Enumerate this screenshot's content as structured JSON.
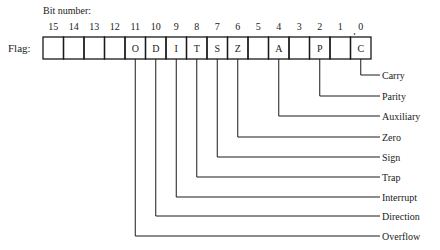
{
  "header": {
    "bit_number_label": "Bit number:"
  },
  "register": {
    "row_label": "Flag:",
    "bits": [
      {
        "bit": "15",
        "flag": ""
      },
      {
        "bit": "14",
        "flag": ""
      },
      {
        "bit": "13",
        "flag": ""
      },
      {
        "bit": "12",
        "flag": ""
      },
      {
        "bit": "11",
        "flag": "O"
      },
      {
        "bit": "10",
        "flag": "D"
      },
      {
        "bit": "9",
        "flag": "I"
      },
      {
        "bit": "8",
        "flag": "T"
      },
      {
        "bit": "7",
        "flag": "S"
      },
      {
        "bit": "6",
        "flag": "Z"
      },
      {
        "bit": "5",
        "flag": ""
      },
      {
        "bit": "4",
        "flag": "A"
      },
      {
        "bit": "3",
        "flag": ""
      },
      {
        "bit": "2",
        "flag": "P"
      },
      {
        "bit": "1",
        "flag": ""
      },
      {
        "bit": "0",
        "flag": "C"
      }
    ]
  },
  "legend": [
    {
      "bit": 0,
      "letter": "C",
      "name": "Carry"
    },
    {
      "bit": 2,
      "letter": "P",
      "name": "Parity"
    },
    {
      "bit": 4,
      "letter": "A",
      "name": "Auxiliary"
    },
    {
      "bit": 6,
      "letter": "Z",
      "name": "Zero"
    },
    {
      "bit": 7,
      "letter": "S",
      "name": "Sign"
    },
    {
      "bit": 8,
      "letter": "T",
      "name": "Trap"
    },
    {
      "bit": 9,
      "letter": "I",
      "name": "Interrupt"
    },
    {
      "bit": 10,
      "letter": "D",
      "name": "Direction"
    },
    {
      "bit": 11,
      "letter": "O",
      "name": "Overflow"
    }
  ],
  "colors": {
    "ink": "#1a1a1a",
    "background": "#ffffff"
  }
}
